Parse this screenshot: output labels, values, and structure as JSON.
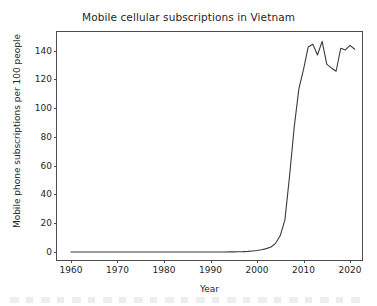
{
  "chart_data": {
    "type": "line",
    "title": "Mobile cellular subscriptions in Vietnam",
    "xlabel": "Year",
    "ylabel": "Mobile phone subscriptions per 100 people",
    "xlim": [
      1957,
      2023
    ],
    "ylim": [
      -7,
      153
    ],
    "grid": false,
    "legend": false,
    "xticks": [
      1960,
      1970,
      1980,
      1990,
      2000,
      2010,
      2020
    ],
    "xtick_labels": [
      "1960",
      "1970",
      "1980",
      "1990",
      "2000",
      "2010",
      "2020"
    ],
    "yticks": [
      0,
      20,
      40,
      60,
      80,
      100,
      120,
      140
    ],
    "ytick_labels": [
      "0",
      "20",
      "40",
      "60",
      "80",
      "100",
      "120",
      "140"
    ],
    "line_color": "#3b3b3b",
    "series": [
      {
        "name": "Mobile cellular subscriptions per 100 people",
        "x": [
          1960,
          1961,
          1962,
          1963,
          1964,
          1965,
          1966,
          1967,
          1968,
          1969,
          1970,
          1971,
          1972,
          1973,
          1974,
          1975,
          1976,
          1977,
          1978,
          1979,
          1980,
          1981,
          1982,
          1983,
          1984,
          1985,
          1986,
          1987,
          1988,
          1989,
          1990,
          1991,
          1992,
          1993,
          1994,
          1995,
          1996,
          1997,
          1998,
          1999,
          2000,
          2001,
          2002,
          2003,
          2004,
          2005,
          2006,
          2007,
          2008,
          2009,
          2010,
          2011,
          2012,
          2013,
          2014,
          2015,
          2016,
          2017,
          2018,
          2019,
          2020,
          2021
        ],
        "values": [
          0,
          0,
          0,
          0,
          0,
          0,
          0,
          0,
          0,
          0,
          0,
          0,
          0,
          0,
          0,
          0,
          0,
          0,
          0,
          0,
          0,
          0,
          0,
          0,
          0,
          0,
          0,
          0,
          0,
          0,
          0,
          0,
          0,
          0,
          0.02,
          0.05,
          0.1,
          0.2,
          0.4,
          0.7,
          1.0,
          1.5,
          2.3,
          3.4,
          6.0,
          11.4,
          22.3,
          52.9,
          87.0,
          113.4,
          127.0,
          142.5,
          144.5,
          137.0,
          146.5,
          130.5,
          128.0,
          125.7,
          141.7,
          140.5,
          143.7,
          141.0
        ]
      }
    ]
  },
  "bottom_artifact": {
    "visible": true,
    "description": "faint cut-off text row"
  }
}
